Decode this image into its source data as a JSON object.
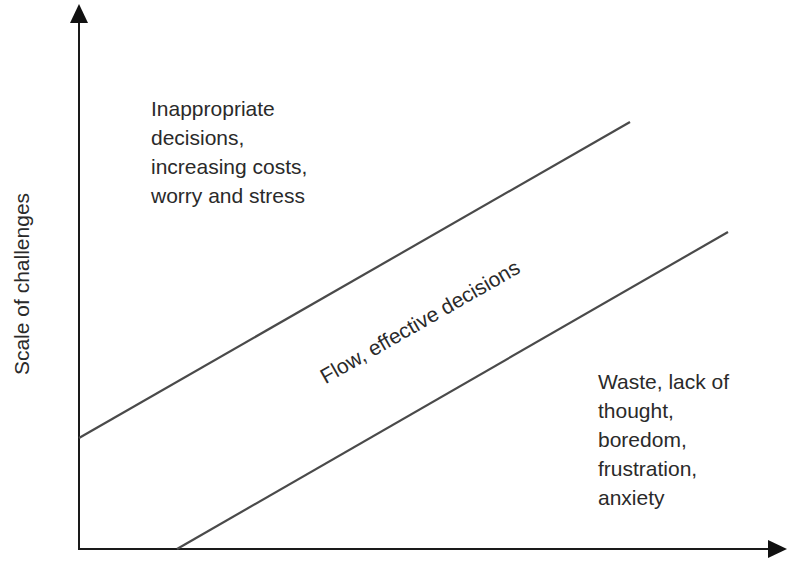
{
  "diagram": {
    "type": "flow-channel",
    "axes": {
      "y_label": "Scale of challenges",
      "x_label": ""
    },
    "regions": {
      "top_left": {
        "lines": [
          "Inappropriate",
          "decisions,",
          "increasing costs,",
          "worry and stress"
        ]
      },
      "channel": {
        "label": "Flow, effective decisions"
      },
      "bottom_right": {
        "lines": [
          "Waste, lack of",
          "thought,",
          "boredom,",
          "frustration,",
          "anxiety"
        ]
      }
    },
    "colors": {
      "axis": "#1a1a1a",
      "line": "#4a4a4a",
      "text": "#2a2a2a",
      "background": "#ffffff"
    }
  }
}
